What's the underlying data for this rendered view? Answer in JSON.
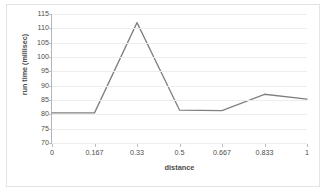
{
  "chart_data": {
    "type": "line",
    "title": "",
    "categories": [
      "0",
      "0.167",
      "0.33",
      "0.5",
      "0.667",
      "0.833",
      "1"
    ],
    "values": [
      80.5,
      80.5,
      112.0,
      81.5,
      81.3,
      87.0,
      85.3
    ],
    "series": [
      {
        "name": "run time",
        "values": [
          80.5,
          80.5,
          112.0,
          81.5,
          81.3,
          87.0,
          85.3
        ],
        "color": "#808080"
      }
    ],
    "xlabel": "distance",
    "ylabel": "run time (millisec)",
    "ylim": [
      70,
      115
    ],
    "ytick_values": [
      70,
      75,
      80,
      85,
      90,
      95,
      100,
      105,
      110,
      115
    ],
    "ytick_labels": [
      "70",
      "75",
      "80",
      "85",
      "90",
      "95",
      "100",
      "105",
      "110",
      "115"
    ],
    "ytick_step": 5,
    "grid": "horizontal",
    "legend": "none",
    "markers": "none",
    "plot_background": "#ffffff",
    "gridline_color": "#ededed",
    "axis_color": "#b5b5b5",
    "border_color": "#e3e3e3",
    "text_color": "#4d4d4d"
  }
}
